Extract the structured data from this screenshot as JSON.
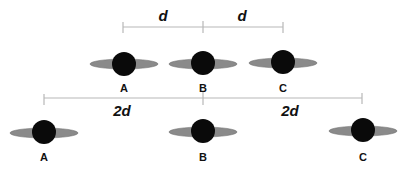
{
  "diagram": {
    "colors": {
      "planet": "#0a0a0a",
      "ring": "#8a8a8a",
      "line": "#b8b8b8",
      "text": "#111111"
    },
    "top_row": {
      "bracket": {
        "left_label": "d",
        "right_label": "d"
      },
      "planets": [
        {
          "label": "A"
        },
        {
          "label": "B"
        },
        {
          "label": "C"
        }
      ]
    },
    "bottom_row": {
      "bracket": {
        "left_label": "2d",
        "right_label": "2d"
      },
      "planets": [
        {
          "label": "A"
        },
        {
          "label": "B"
        },
        {
          "label": "C"
        }
      ]
    }
  }
}
